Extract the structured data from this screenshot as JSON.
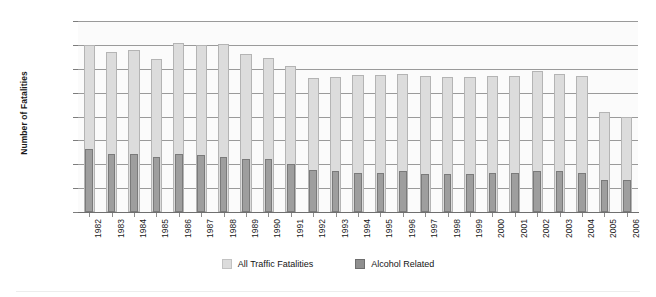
{
  "chart_data": {
    "type": "bar",
    "title": "",
    "subtitle": "",
    "xlabel": "",
    "ylabel": "Number of Fatalities",
    "ylim": [
      0,
      80000
    ],
    "ytick_labels": [
      "0",
      "10,000",
      "20,000",
      "30,000",
      "40,000",
      "50,000",
      "60,000",
      "70,000",
      "80,000"
    ],
    "ytick_values": [
      0,
      10000,
      20000,
      30000,
      40000,
      50000,
      60000,
      70000,
      80000
    ],
    "grid": true,
    "legend_position": "bottom-center",
    "bar_style": "overlapped",
    "categories": [
      "1982",
      "1983",
      "1984",
      "1985",
      "1986",
      "1987",
      "1988",
      "1989",
      "1990",
      "1991",
      "1992",
      "1993",
      "1994",
      "1995",
      "1996",
      "1997",
      "1998",
      "1999",
      "2000",
      "2001",
      "2002",
      "2003",
      "2004",
      "2005",
      "2006"
    ],
    "series": [
      {
        "name": "All Traffic Fatalities",
        "color": "#dcdcdc",
        "values": [
          70000,
          67000,
          68000,
          64000,
          71000,
          70000,
          70500,
          66000,
          64500,
          61000,
          56000,
          56500,
          57500,
          57500,
          58000,
          57000,
          56500,
          56500,
          57000,
          57000,
          59000,
          58000,
          57000,
          42000,
          40000
        ]
      },
      {
        "name": "Alcohol Related",
        "color": "#9e9e9e",
        "values": [
          26500,
          24500,
          24500,
          23000,
          24500,
          24000,
          23000,
          22000,
          22000,
          20000,
          17500,
          17000,
          16500,
          16500,
          17000,
          16000,
          16000,
          16000,
          16500,
          16500,
          17000,
          17000,
          16500,
          13500,
          13500
        ]
      }
    ]
  },
  "legend": {
    "entries": [
      {
        "label": "All Traffic Fatalities",
        "swatch": "legend-swatch-total"
      },
      {
        "label": "Alcohol Related",
        "swatch": "legend-swatch-alcohol"
      }
    ]
  },
  "colors": {
    "total_fill": "#dcdcdc",
    "total_stroke": "#b4b4b4",
    "alcohol_fill": "#9e9e9e",
    "alcohol_stroke": "#7a7a7a",
    "gridline": "#9a9a9a",
    "axis": "#6f6f6f",
    "text": "#1a1a1a",
    "plot_background": "#fbfbfb"
  }
}
